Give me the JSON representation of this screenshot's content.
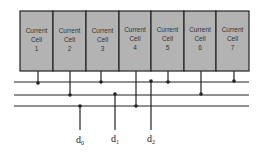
{
  "diagram": {
    "cells": [
      {
        "line1": "Current",
        "line2": "Cell",
        "num": "1"
      },
      {
        "line1": "Current",
        "line2": "Cell",
        "num": "2"
      },
      {
        "line1": "Current",
        "line2": "Cell",
        "num": "3"
      },
      {
        "line1": "Current",
        "line2": "Cell",
        "num": "4"
      },
      {
        "line1": "Current",
        "line2": "Cell",
        "num": "5"
      },
      {
        "line1": "Current",
        "line2": "Cell",
        "num": "6"
      },
      {
        "line1": "Current",
        "line2": "Cell",
        "num": "7"
      }
    ],
    "inputs": [
      {
        "base": "d",
        "sub": "0"
      },
      {
        "base": "d",
        "sub": "1"
      },
      {
        "base": "d",
        "sub": "2"
      }
    ],
    "colors": {
      "cell_fill": "#b3b3b3",
      "line": "#222222"
    }
  }
}
